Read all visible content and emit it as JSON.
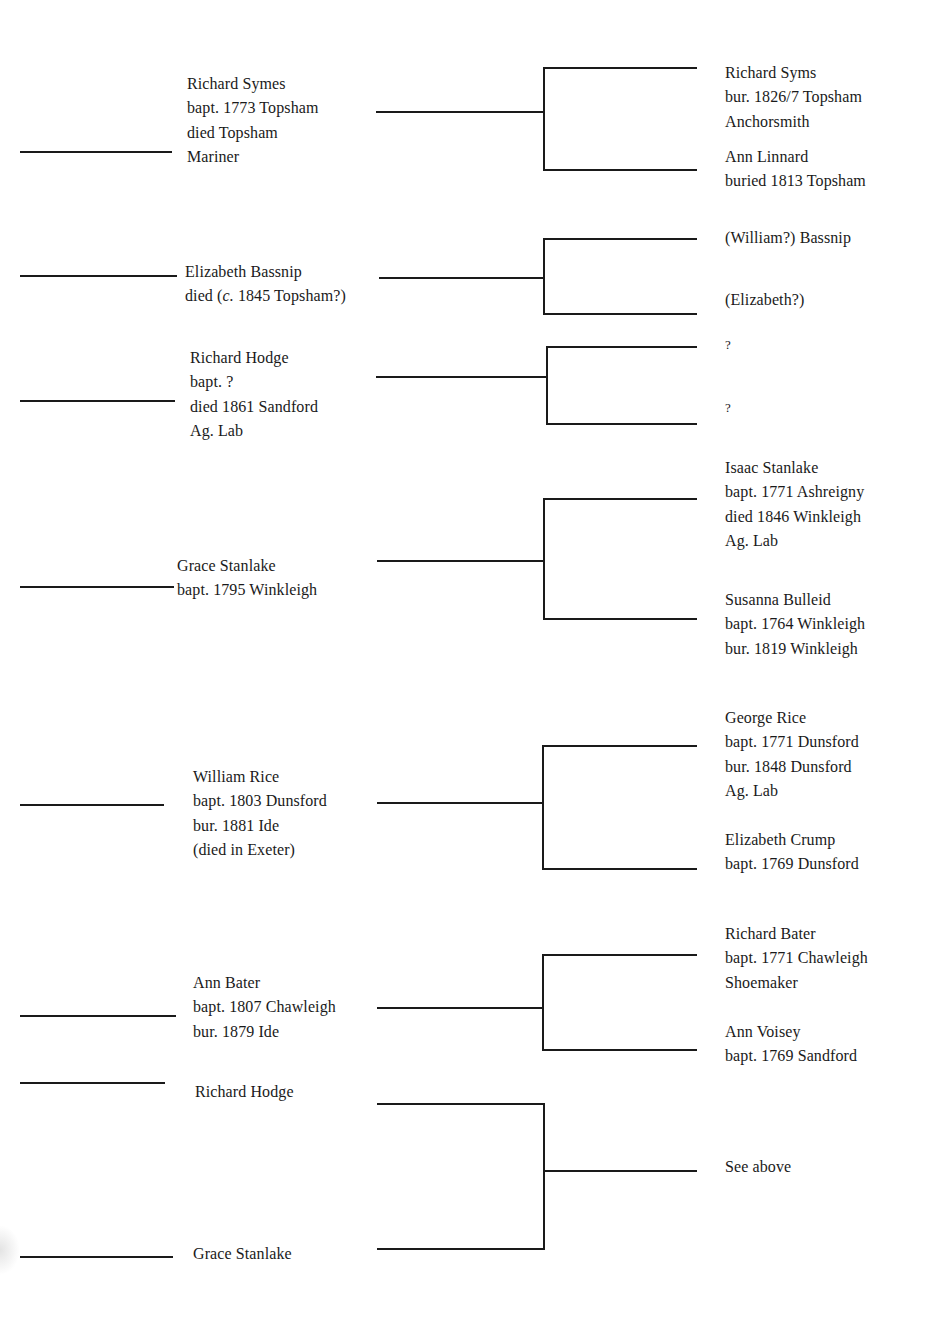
{
  "generation1": [
    {
      "id": "richard-symes",
      "lines": [
        "Richard Symes",
        "bapt. 1773 Topsham",
        "died Topsham",
        "Mariner"
      ]
    },
    {
      "id": "elizabeth-bassnip",
      "lines": [
        "Elizabeth Bassnip"
      ],
      "died_prefix": "died (",
      "died_circa": "c.",
      "died_suffix": " 1845 Topsham?)"
    },
    {
      "id": "richard-hodge",
      "lines": [
        "Richard Hodge",
        "bapt. ?",
        "died 1861 Sandford",
        "Ag. Lab"
      ]
    },
    {
      "id": "grace-stanlake",
      "lines": [
        "Grace Stanlake",
        "bapt. 1795 Winkleigh"
      ]
    },
    {
      "id": "william-rice",
      "lines": [
        "William Rice",
        "bapt. 1803 Dunsford",
        "bur. 1881 Ide",
        "(died in Exeter)"
      ]
    },
    {
      "id": "ann-bater",
      "lines": [
        "Ann Bater",
        "bapt. 1807 Chawleigh",
        "bur. 1879 Ide"
      ]
    },
    {
      "id": "richard-hodge-repeat",
      "lines": [
        "Richard Hodge"
      ]
    },
    {
      "id": "grace-stanlake-repeat",
      "lines": [
        "Grace Stanlake"
      ]
    }
  ],
  "generation2": [
    {
      "id": "richard-syms",
      "lines": [
        "Richard Syms",
        "bur. 1826/7 Topsham",
        "Anchorsmith"
      ]
    },
    {
      "id": "ann-linnard",
      "lines": [
        "Ann Linnard",
        "buried 1813 Topsham"
      ]
    },
    {
      "id": "william-bassnip",
      "lines": [
        "(William?) Bassnip"
      ]
    },
    {
      "id": "elizabeth-unknown",
      "lines": [
        "(Elizabeth?)"
      ]
    },
    {
      "id": "unknown-father",
      "lines": [
        "?"
      ]
    },
    {
      "id": "unknown-mother",
      "lines": [
        "?"
      ]
    },
    {
      "id": "isaac-stanlake",
      "lines": [
        "Isaac Stanlake",
        "bapt. 1771 Ashreigny",
        "died 1846 Winkleigh",
        "Ag. Lab"
      ]
    },
    {
      "id": "susanna-bulleid",
      "lines": [
        "Susanna Bulleid",
        "bapt. 1764 Winkleigh",
        "bur. 1819 Winkleigh"
      ]
    },
    {
      "id": "george-rice",
      "lines": [
        "George Rice",
        "bapt. 1771 Dunsford",
        "bur. 1848 Dunsford",
        "Ag. Lab"
      ]
    },
    {
      "id": "elizabeth-crump",
      "lines": [
        "Elizabeth Crump",
        "bapt. 1769 Dunsford"
      ]
    },
    {
      "id": "richard-bater",
      "lines": [
        "Richard Bater",
        "bapt. 1771 Chawleigh",
        "Shoemaker"
      ]
    },
    {
      "id": "ann-voisey",
      "lines": [
        "Ann Voisey",
        "bapt. 1769 Sandford"
      ]
    },
    {
      "id": "see-above",
      "lines": [
        "See above"
      ]
    }
  ],
  "colors": {
    "line": "#1a1a1a",
    "background": "#ffffff",
    "text": "#1a1a1a"
  }
}
